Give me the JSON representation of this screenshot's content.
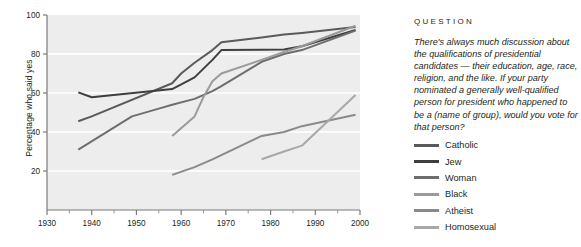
{
  "chart_data": {
    "type": "line",
    "title": "",
    "xlabel": "",
    "ylabel": "Percentage who said yes",
    "xlim": [
      1930,
      2000
    ],
    "ylim": [
      0,
      100
    ],
    "grid": "horizontal",
    "legend_position": "right",
    "x_ticks": [
      1930,
      1940,
      1950,
      1960,
      1970,
      1980,
      1990,
      2000
    ],
    "x_tick_labels": [
      "1930",
      "1940",
      "1950",
      "1960",
      "1970",
      "1980",
      "1990",
      "2000"
    ],
    "x_minor_ticks": [
      1935,
      1945,
      1955,
      1965,
      1975,
      1985,
      1995
    ],
    "y_ticks": [
      20,
      40,
      60,
      80,
      100
    ],
    "y_tick_labels": [
      "20",
      "40",
      "60",
      "80",
      "100"
    ],
    "series": [
      {
        "name": "Catholic",
        "color": "#5a5a5a",
        "points": [
          [
            1937,
            45.5
          ],
          [
            1940,
            48.0
          ],
          [
            1958,
            65.0
          ],
          [
            1960,
            70.0
          ],
          [
            1963,
            75.5
          ],
          [
            1967,
            82.0
          ],
          [
            1969,
            86.0
          ],
          [
            1978,
            88.5
          ],
          [
            1983,
            90.0
          ],
          [
            1987,
            90.8
          ],
          [
            1999,
            93.8
          ]
        ]
      },
      {
        "name": "Jew",
        "color": "#3f3f3f",
        "points": [
          [
            1937,
            60.3
          ],
          [
            1940,
            57.8
          ],
          [
            1958,
            62.0
          ],
          [
            1963,
            68.0
          ],
          [
            1967,
            77.0
          ],
          [
            1969,
            82.0
          ],
          [
            1978,
            82.2
          ],
          [
            1983,
            82.3
          ],
          [
            1987,
            84.0
          ],
          [
            1999,
            92.3
          ]
        ]
      },
      {
        "name": "Woman",
        "color": "#6e6e6e",
        "points": [
          [
            1937,
            31.0
          ],
          [
            1949,
            48.0
          ],
          [
            1955,
            52.0
          ],
          [
            1958,
            54.0
          ],
          [
            1963,
            57.0
          ],
          [
            1967,
            61.0
          ],
          [
            1969,
            63.5
          ],
          [
            1978,
            76.0
          ],
          [
            1983,
            80.0
          ],
          [
            1987,
            82.0
          ],
          [
            1999,
            92.0
          ]
        ]
      },
      {
        "name": "Black",
        "color": "#9a9a9a",
        "points": [
          [
            1958,
            38.0
          ],
          [
            1963,
            48.0
          ],
          [
            1965,
            58.0
          ],
          [
            1967,
            66.0
          ],
          [
            1969,
            70.0
          ],
          [
            1978,
            77.0
          ],
          [
            1983,
            81.0
          ],
          [
            1987,
            84.0
          ],
          [
            1999,
            94.5
          ]
        ]
      },
      {
        "name": "Atheist",
        "color": "#8a8a8a",
        "points": [
          [
            1958,
            18.0
          ],
          [
            1963,
            22.0
          ],
          [
            1967,
            26.0
          ],
          [
            1978,
            38.0
          ],
          [
            1983,
            40.0
          ],
          [
            1987,
            43.0
          ],
          [
            1999,
            48.8
          ]
        ]
      },
      {
        "name": "Homosexual",
        "color": "#a8a8a8",
        "points": [
          [
            1978,
            26.0
          ],
          [
            1983,
            30.0
          ],
          [
            1987,
            33.0
          ],
          [
            1999,
            59.0
          ]
        ]
      }
    ]
  },
  "question": {
    "heading": "QUESTION",
    "body": "There's always much discussion about the qualifications of presidential candidates — their education, age, race, religion, and the like. If your party nominated a generally well-qualified person for president who happened to be a (name of group), would you vote for that person?"
  }
}
